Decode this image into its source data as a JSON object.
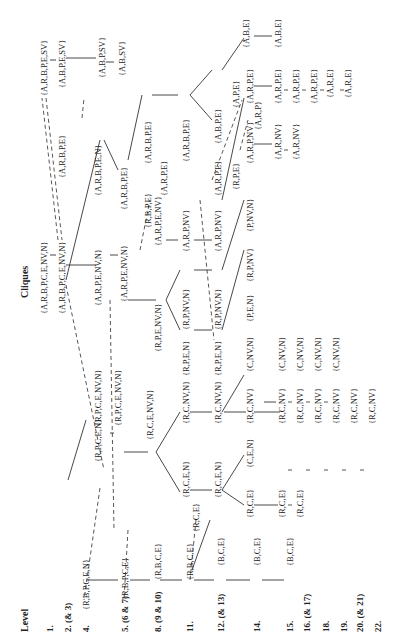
{
  "header": {
    "level_title": "Level",
    "cliques_title": "Cliques"
  },
  "levels": [
    {
      "id": "1",
      "label": "1.",
      "x": 50
    },
    {
      "id": "2",
      "label": "2. (& 3)",
      "x": 68
    },
    {
      "id": "4",
      "label": "4.",
      "x": 86
    },
    {
      "id": "5",
      "label": "5. (6 & 7)",
      "x": 125
    },
    {
      "id": "8",
      "label": "8. (9 & 10)",
      "x": 158
    },
    {
      "id": "11",
      "label": "11.",
      "x": 190
    },
    {
      "id": "12",
      "label": "12. (& 13)",
      "x": 221
    },
    {
      "id": "14",
      "label": "14.",
      "x": 257
    },
    {
      "id": "15",
      "label": "15.",
      "x": 290
    },
    {
      "id": "16",
      "label": "16. (& 17)",
      "x": 307
    },
    {
      "id": "18",
      "label": "18.",
      "x": 326
    },
    {
      "id": "19",
      "label": "19.",
      "x": 344
    },
    {
      "id": "20",
      "label": "20. (& 21)",
      "x": 360
    },
    {
      "id": "22",
      "label": "22.",
      "x": 378
    }
  ],
  "cliques": [
    {
      "t": "{A,R,B,P,E,SV}",
      "x": 44,
      "y": 96
    },
    {
      "t": "{A,B,P,E,SV}",
      "x": 62,
      "y": 88
    },
    {
      "t": "{A,B,P,SV}",
      "x": 102,
      "y": 78
    },
    {
      "t": "{A,B,SV}",
      "x": 122,
      "y": 76
    },
    {
      "t": "{A,R,B,P,C,E,NV,N}",
      "x": 44,
      "y": 314
    },
    {
      "t": "{A,R,B,P,C,E,NV,N}",
      "x": 62,
      "y": 314
    },
    {
      "t": "{A,R,B,P,E}",
      "x": 62,
      "y": 178
    },
    {
      "t": "{A,R,B,P,E,N}",
      "x": 98,
      "y": 196
    },
    {
      "t": "{A,R,P,E,NV,N}",
      "x": 98,
      "y": 306
    },
    {
      "t": "{A,R,P,E,NV,N}",
      "x": 124,
      "y": 302
    },
    {
      "t": "{A,R,B,P,E}",
      "x": 124,
      "y": 210
    },
    {
      "t": "{R,B,P,E}",
      "x": 148,
      "y": 228
    },
    {
      "t": "{A,R,B,P,E}",
      "x": 148,
      "y": 164
    },
    {
      "t": "{A,R,P,E,NV}",
      "x": 158,
      "y": 246
    },
    {
      "t": "{A,R,P,E}",
      "x": 164,
      "y": 196
    },
    {
      "t": "{R,P,E,NV,N}",
      "x": 158,
      "y": 352
    },
    {
      "t": "{A,R,B,P,E}",
      "x": 186,
      "y": 162
    },
    {
      "t": "{A,R,P,NV}",
      "x": 186,
      "y": 252
    },
    {
      "t": "{R,P,NV,N}",
      "x": 186,
      "y": 330
    },
    {
      "t": "{R,P,E,N}",
      "x": 186,
      "y": 376
    },
    {
      "t": "{A,B,P,E}",
      "x": 218,
      "y": 144
    },
    {
      "t": "{A,R,P,E}",
      "x": 218,
      "y": 196
    },
    {
      "t": "{A,R,P,NV}",
      "x": 218,
      "y": 252
    },
    {
      "t": "{R,P,NV,N}",
      "x": 218,
      "y": 330
    },
    {
      "t": "{R,P,E,N}",
      "x": 218,
      "y": 376
    },
    {
      "t": "{A,P,E}",
      "x": 236,
      "y": 108
    },
    {
      "t": "{R,P,E}",
      "x": 236,
      "y": 190
    },
    {
      "t": "{A,B,E}",
      "x": 246,
      "y": 48
    },
    {
      "t": "{A,R,P,E}",
      "x": 250,
      "y": 104
    },
    {
      "t": "{A,R,P}",
      "x": 258,
      "y": 130
    },
    {
      "t": "{A,R,P,NV}",
      "x": 250,
      "y": 164
    },
    {
      "t": "{P,NV,N}",
      "x": 250,
      "y": 232
    },
    {
      "t": "{R,P,NV}",
      "x": 250,
      "y": 282
    },
    {
      "t": "{P,E,N}",
      "x": 250,
      "y": 322
    },
    {
      "t": "{C,NV,N}",
      "x": 250,
      "y": 372
    },
    {
      "t": "{A,B,E}",
      "x": 278,
      "y": 48
    },
    {
      "t": "{A,R,P,E}",
      "x": 278,
      "y": 104
    },
    {
      "t": "{A,R,NV}",
      "x": 278,
      "y": 160
    },
    {
      "t": "{A,R,P,E}",
      "x": 296,
      "y": 104
    },
    {
      "t": "{A,R,NV}",
      "x": 296,
      "y": 160
    },
    {
      "t": "{A,R,P,E}",
      "x": 314,
      "y": 104
    },
    {
      "t": "{A,R,E}",
      "x": 330,
      "y": 98
    },
    {
      "t": "{A,R,E}",
      "x": 348,
      "y": 98
    },
    {
      "t": "{C,NV,N}",
      "x": 282,
      "y": 372
    },
    {
      "t": "{C,NV,N}",
      "x": 300,
      "y": 372
    },
    {
      "t": "{C,NV,N}",
      "x": 318,
      "y": 372
    },
    {
      "t": "{C,NV,N}",
      "x": 336,
      "y": 372
    },
    {
      "t": "{R,P,C,E,NV,N}",
      "x": 98,
      "y": 426
    },
    {
      "t": "{R,P,C,E,NV,N}",
      "x": 118,
      "y": 426
    },
    {
      "t": "{R,P,C,E,N}",
      "x": 98,
      "y": 462
    },
    {
      "t": "{R,C,E,NV,N}",
      "x": 150,
      "y": 440
    },
    {
      "t": "{R,C,NV,N}",
      "x": 186,
      "y": 424
    },
    {
      "t": "{R,C,NV,N}",
      "x": 218,
      "y": 424
    },
    {
      "t": "{R,C,NV}",
      "x": 250,
      "y": 424
    },
    {
      "t": "{R,C,NV}",
      "x": 282,
      "y": 424
    },
    {
      "t": "{R,C,NV}",
      "x": 300,
      "y": 424
    },
    {
      "t": "{R,C,NV}",
      "x": 318,
      "y": 424
    },
    {
      "t": "{R,C,NV}",
      "x": 336,
      "y": 424
    },
    {
      "t": "{R,C,NV}",
      "x": 354,
      "y": 424
    },
    {
      "t": "{R,C,NV}",
      "x": 372,
      "y": 424
    },
    {
      "t": "{R,C,E,N}",
      "x": 186,
      "y": 498
    },
    {
      "t": "{R,C,E,N}",
      "x": 218,
      "y": 498
    },
    {
      "t": "{R,C,E}",
      "x": 196,
      "y": 532
    },
    {
      "t": "{C,E,N}",
      "x": 250,
      "y": 468
    },
    {
      "t": "{R,C,E}",
      "x": 250,
      "y": 518
    },
    {
      "t": "{R,C,E}",
      "x": 282,
      "y": 518
    },
    {
      "t": "{R,C,E}",
      "x": 300,
      "y": 518
    },
    {
      "t": "{R,B,P,C,E,N}",
      "x": 86,
      "y": 610
    },
    {
      "t": "{R,B,P,C,E}",
      "x": 125,
      "y": 600
    },
    {
      "t": "{R,B,C,E}",
      "x": 158,
      "y": 580
    },
    {
      "t": "{R,B,C,E}",
      "x": 190,
      "y": 580
    },
    {
      "t": "{B,C,E}",
      "x": 221,
      "y": 566
    },
    {
      "t": "{B,C,E}",
      "x": 257,
      "y": 566
    },
    {
      "t": "{B,C,E}",
      "x": 290,
      "y": 566
    }
  ]
}
